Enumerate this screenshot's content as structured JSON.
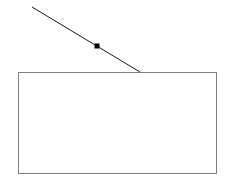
{
  "canvas": {
    "width": 227,
    "height": 185,
    "background_color": "#ffffff"
  },
  "figure": {
    "title": "",
    "elements": [
      {
        "name": "rectangle",
        "shape": "rectangle",
        "x": 18,
        "y": 72,
        "width": 198,
        "height": 101,
        "stroke_color": "#808080",
        "stroke_width": 1,
        "fill": "none"
      },
      {
        "name": "diagonal-line",
        "shape": "line",
        "x1": 32,
        "y1": 7,
        "x2": 140,
        "y2": 72,
        "stroke_color": "#1a1a1a",
        "stroke_width": 1
      },
      {
        "name": "point-marker",
        "shape": "square-marker",
        "cx": 97,
        "cy": 46,
        "size": 5,
        "fill_color": "#000000"
      }
    ]
  }
}
